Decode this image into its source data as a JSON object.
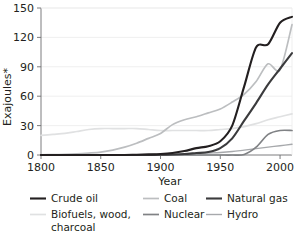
{
  "chart_data": {
    "type": "line",
    "title": "",
    "subtitle": "",
    "xlabel": "Year",
    "ylabel": "Exajoules*",
    "xlim": [
      1800,
      2010
    ],
    "ylim": [
      0,
      150
    ],
    "xticks": [
      1800,
      1850,
      1900,
      1950,
      2000
    ],
    "yticks": [
      0,
      30,
      60,
      90,
      120,
      150
    ],
    "xtick_labels": [
      "1800",
      "1850",
      "1900",
      "1950",
      "2000"
    ],
    "ytick_labels": [
      "0",
      "30",
      "60",
      "90",
      "120",
      "150"
    ],
    "grid": "horizontal",
    "legend_position": "below",
    "x": [
      1800,
      1810,
      1820,
      1830,
      1840,
      1850,
      1860,
      1870,
      1880,
      1890,
      1900,
      1910,
      1920,
      1930,
      1940,
      1950,
      1960,
      1970,
      1980,
      1990,
      2000,
      2010
    ],
    "series": [
      {
        "name": "Crude oil",
        "color": "#231f20",
        "width": 2.1,
        "values": [
          0,
          0,
          0,
          0,
          0,
          0,
          0,
          0,
          0.3,
          0.6,
          1,
          2,
          4,
          7,
          9,
          14,
          30,
          70,
          110,
          113,
          135,
          141
        ]
      },
      {
        "name": "Coal",
        "color": "#bcbec0",
        "width": 1.7,
        "values": [
          0.2,
          0.4,
          0.7,
          1.2,
          2,
          3,
          5,
          8,
          12,
          17,
          22,
          31,
          36,
          39,
          43,
          47,
          54,
          62,
          75,
          93,
          87,
          133
        ]
      },
      {
        "name": "Natural gas",
        "color": "#3b3b3d",
        "width": 2.1,
        "values": [
          0,
          0,
          0,
          0,
          0,
          0,
          0,
          0,
          0,
          0,
          0.2,
          0.5,
          1,
          2,
          3,
          7,
          17,
          35,
          53,
          72,
          88,
          104
        ]
      },
      {
        "name": "Biofuels, wood, charcoal",
        "color": "#e0e1e2",
        "width": 1.7,
        "values": [
          20,
          21,
          22,
          24,
          26,
          27,
          27,
          27,
          27,
          26,
          25,
          25,
          25,
          25,
          25,
          26,
          27,
          29,
          32,
          36,
          39,
          42
        ]
      },
      {
        "name": "Nuclear",
        "color": "#808285",
        "width": 1.7,
        "values": [
          0,
          0,
          0,
          0,
          0,
          0,
          0,
          0,
          0,
          0,
          0,
          0,
          0,
          0,
          0,
          0,
          0,
          0.5,
          8,
          21,
          25,
          25
        ]
      },
      {
        "name": "Hydro",
        "color": "#a7a9ac",
        "width": 1.4,
        "values": [
          0,
          0,
          0,
          0,
          0,
          0,
          0,
          0,
          0,
          0,
          0.2,
          0.5,
          1,
          1.5,
          2,
          2.5,
          3.5,
          5,
          6.5,
          8,
          9.5,
          11
        ]
      }
    ]
  },
  "legend": {
    "items": [
      {
        "label": "Crude oil"
      },
      {
        "label": "Coal"
      },
      {
        "label": "Natural gas"
      },
      {
        "label": "Biofuels, wood,"
      },
      {
        "label": "Nuclear"
      },
      {
        "label": "Hydro"
      }
    ],
    "biofuels_line2": "charcoal"
  }
}
